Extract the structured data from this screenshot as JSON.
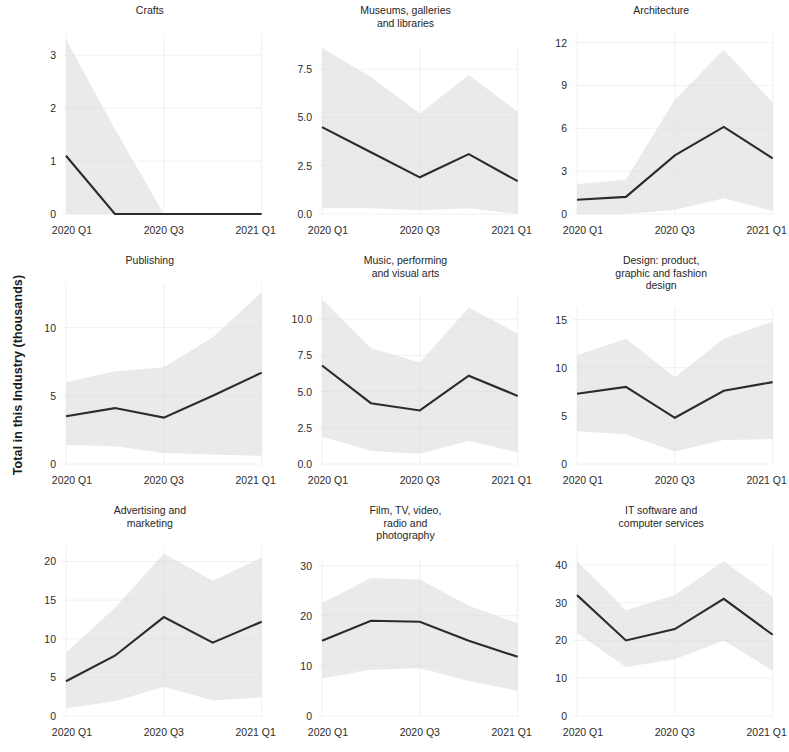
{
  "figure": {
    "ylabel": "Total in this Industry (thousands)",
    "line_color": "#2b2b2b",
    "band_color": "#d9d9d9",
    "background": "#ffffff"
  },
  "chart_data": {
    "type": "line",
    "title": "",
    "xlabel": "",
    "ylabel": "Total in this Industry (thousands)",
    "grid": true,
    "legend": "none",
    "x": [
      "2020 Q1",
      "2020 Q2",
      "2020 Q3",
      "2020 Q4",
      "2021 Q1"
    ],
    "xtick_labels": [
      "2020 Q1",
      "2020 Q3",
      "2021 Q1"
    ],
    "xtick_indices": [
      0,
      2,
      4
    ],
    "panels": [
      {
        "title": "Crafts",
        "row": 0,
        "col": 0,
        "ylim": [
          0,
          3.4
        ],
        "yticks": [
          0,
          1,
          2,
          3
        ],
        "ytick_labels": [
          "0",
          "1",
          "2",
          "3"
        ],
        "yaxis_side": "left",
        "values": [
          1.1,
          0.0,
          0.0,
          0.0,
          0.0
        ],
        "band_lower": [
          0.0,
          0.0,
          0.0,
          0.0,
          0.0
        ],
        "band_upper": [
          3.3,
          1.6,
          0.0,
          0.0,
          0.0
        ]
      },
      {
        "title": "Museums, galleries\nand libraries",
        "row": 0,
        "col": 1,
        "ylim": [
          0,
          8.7
        ],
        "yticks": [
          0.0,
          2.5,
          5.0,
          7.5
        ],
        "ytick_labels": [
          "0.0",
          "2.5",
          "5.0",
          "7.5"
        ],
        "yaxis_side": "left",
        "values": [
          4.5,
          3.2,
          1.9,
          3.1,
          1.7
        ],
        "band_lower": [
          0.3,
          0.3,
          0.2,
          0.3,
          0.0
        ],
        "band_upper": [
          8.6,
          7.1,
          5.2,
          7.2,
          5.3
        ]
      },
      {
        "title": "Architecture",
        "row": 0,
        "col": 2,
        "ylim": [
          0,
          12.6
        ],
        "yticks": [
          0,
          3,
          6,
          9,
          12
        ],
        "ytick_labels": [
          "0",
          "3",
          "6",
          "9",
          "12"
        ],
        "yaxis_side": "left",
        "values": [
          1.0,
          1.2,
          4.1,
          6.1,
          3.9
        ],
        "band_lower": [
          0.0,
          0.0,
          0.3,
          1.1,
          0.2
        ],
        "band_upper": [
          2.1,
          2.4,
          8.0,
          11.5,
          7.8
        ]
      },
      {
        "title": "Publishing",
        "row": 1,
        "col": 0,
        "ylim": [
          0,
          13.2
        ],
        "yticks": [
          0,
          5,
          10
        ],
        "ytick_labels": [
          "0",
          "5",
          "10"
        ],
        "yaxis_side": "left",
        "values": [
          3.5,
          4.1,
          3.4,
          5.0,
          6.7
        ],
        "band_lower": [
          1.4,
          1.3,
          0.8,
          0.7,
          0.6
        ],
        "band_upper": [
          6.0,
          6.8,
          7.1,
          9.3,
          12.6
        ]
      },
      {
        "title": "Music, performing\nand visual arts",
        "row": 1,
        "col": 1,
        "ylim": [
          0,
          11.6
        ],
        "yticks": [
          0.0,
          2.5,
          5.0,
          7.5,
          10.0
        ],
        "ytick_labels": [
          "0.0",
          "2.5",
          "5.0",
          "7.5",
          "10.0"
        ],
        "yaxis_side": "left",
        "values": [
          6.8,
          4.2,
          3.7,
          6.1,
          4.7
        ],
        "band_lower": [
          1.9,
          0.9,
          0.7,
          1.6,
          0.8
        ],
        "band_upper": [
          11.4,
          8.0,
          7.0,
          10.8,
          9.0
        ]
      },
      {
        "title": "Design: product,\ngraphic and fashion\ndesign",
        "row": 1,
        "col": 2,
        "ylim": [
          0,
          16.2
        ],
        "yticks": [
          0,
          5,
          10,
          15
        ],
        "ytick_labels": [
          "0",
          "5",
          "10",
          "15"
        ],
        "yaxis_side": "left",
        "values": [
          7.3,
          8.0,
          4.8,
          7.6,
          8.5
        ],
        "band_lower": [
          3.4,
          3.1,
          1.3,
          2.5,
          2.6
        ],
        "band_upper": [
          11.3,
          13.0,
          9.0,
          13.0,
          14.8
        ]
      },
      {
        "title": "Advertising and\nmarketing",
        "row": 2,
        "col": 0,
        "ylim": [
          0,
          22.0
        ],
        "yticks": [
          0,
          5,
          10,
          15,
          20
        ],
        "ytick_labels": [
          "0",
          "5",
          "10",
          "15",
          "20"
        ],
        "yaxis_side": "left",
        "values": [
          4.5,
          7.8,
          12.8,
          9.5,
          12.2
        ],
        "band_lower": [
          1.0,
          1.9,
          3.8,
          2.0,
          2.4
        ],
        "band_upper": [
          8.2,
          14.0,
          21.0,
          17.5,
          20.5
        ]
      },
      {
        "title": "Film, TV, video,\nradio and\nphotography",
        "row": 2,
        "col": 1,
        "ylim": [
          0,
          31.5
        ],
        "yticks": [
          0,
          10,
          20,
          30
        ],
        "ytick_labels": [
          "0",
          "10",
          "20",
          "30"
        ],
        "yaxis_side": "left",
        "values": [
          15.0,
          19.0,
          18.8,
          15.0,
          11.8
        ],
        "band_lower": [
          7.5,
          9.2,
          9.5,
          7.0,
          5.0
        ],
        "band_upper": [
          22.5,
          27.5,
          27.2,
          22.0,
          18.5
        ]
      },
      {
        "title": "IT software and\ncomputer services",
        "row": 2,
        "col": 2,
        "ylim": [
          0,
          45.0
        ],
        "yticks": [
          0,
          10,
          20,
          30,
          40
        ],
        "ytick_labels": [
          "0",
          "10",
          "20",
          "30",
          "40"
        ],
        "yaxis_side": "left",
        "values": [
          32.0,
          20.0,
          23.0,
          31.0,
          21.5
        ],
        "band_lower": [
          22.0,
          13.0,
          15.0,
          20.0,
          12.0
        ],
        "band_upper": [
          41.0,
          28.0,
          32.0,
          41.0,
          31.5
        ]
      }
    ]
  }
}
